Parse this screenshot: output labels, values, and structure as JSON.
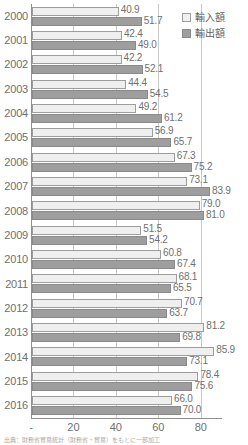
{
  "legend": {
    "position": "top-right",
    "entries": [
      {
        "key": "import",
        "label": "輸入額",
        "swatch_name": "legend-swatch-import",
        "color": "#efefef"
      },
      {
        "key": "export",
        "label": "輸出額",
        "swatch_name": "legend-swatch-export",
        "color": "#9e9e9e"
      }
    ]
  },
  "source_note": "出典：財務省貿易統計（財務省・貿易）をもとに一部加工",
  "axis": {
    "x_ticks": [
      "-",
      "20",
      "40",
      "60",
      "80"
    ],
    "x_tick_values": [
      0,
      20,
      40,
      60,
      80
    ]
  },
  "chart_data": {
    "type": "bar",
    "orientation": "horizontal",
    "title": "",
    "subtitle": "",
    "xlabel": "",
    "ylabel": "",
    "xlim": [
      0,
      90
    ],
    "grid": true,
    "legend_position": "top-right",
    "categories": [
      "2000",
      "2001",
      "2002",
      "2003",
      "2004",
      "2005",
      "2006",
      "2007",
      "2008",
      "2009",
      "2010",
      "2011",
      "2012",
      "2013",
      "2014",
      "2015",
      "2016"
    ],
    "series": [
      {
        "name": "輸入額",
        "color": "#efefef",
        "values": [
          40.9,
          42.4,
          42.2,
          44.4,
          49.2,
          56.9,
          67.3,
          73.1,
          79.0,
          51.5,
          60.8,
          68.1,
          70.7,
          81.2,
          85.9,
          78.4,
          66.0
        ]
      },
      {
        "name": "輸出額",
        "color": "#9e9e9e",
        "values": [
          51.7,
          49.0,
          52.1,
          54.5,
          61.2,
          65.7,
          75.2,
          83.9,
          81.0,
          54.2,
          67.4,
          65.5,
          63.7,
          69.8,
          73.1,
          75.6,
          70.0
        ]
      }
    ]
  }
}
